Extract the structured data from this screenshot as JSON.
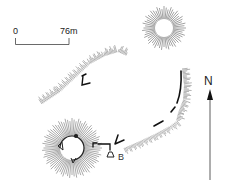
{
  "scale_bar": {
    "start_label": "0",
    "end_label": "76m"
  },
  "labels": {
    "feature_b": "B"
  },
  "north_arrow": {
    "letter": "N"
  },
  "features": [
    {
      "name": "northeast-mound",
      "type": "radial-hachure-mound"
    },
    {
      "name": "southwest-mound",
      "type": "radial-hachure-mound"
    },
    {
      "name": "northwest-ridge",
      "type": "linear-hachure-bank"
    },
    {
      "name": "east-bank",
      "type": "linear-hachure-bank"
    },
    {
      "name": "south-bank",
      "type": "linear-hachure-bank"
    },
    {
      "name": "structure-b",
      "type": "wall-outline"
    }
  ],
  "colors": {
    "ink": "#222222",
    "hachure": "#555555",
    "background": "#ffffff"
  }
}
